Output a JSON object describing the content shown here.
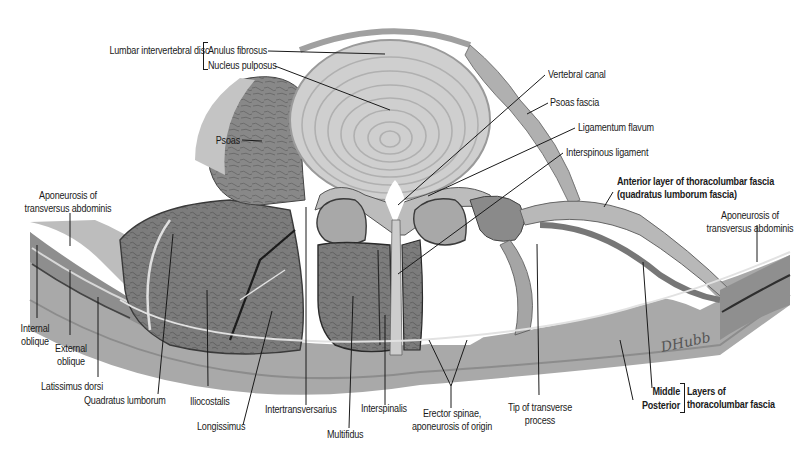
{
  "figure": {
    "colors": {
      "background": "#ffffff",
      "label_text": "#1a1a1a",
      "leader_line": "#1a1a1a",
      "disc_light": "#d6d6d6",
      "disc_ring": "#b4b4b4",
      "muscle_dark": "#6e6e6e",
      "muscle_mid": "#8a8a8a",
      "fascia_light": "#c8c8c8",
      "skin_band": "#a8a8a8"
    },
    "signature": "DHubb"
  },
  "labels": {
    "lumbar_disc": "Lumbar intervertebral disc",
    "anulus_fibrosus": "Anulus fibrosus",
    "nucleus_pulposus": "Nucleus pulposus",
    "vertebral_canal": "Vertebral canal",
    "psoas_fascia": "Psoas fascia",
    "ligamentum_flavum": "Ligamentum flavum",
    "interspinous_ligament": "Interspinous ligament",
    "psoas": "Psoas",
    "anterior_layer_1": "Anterior layer of thoracolumbar fascia",
    "anterior_layer_2": "(quadratus lumborum fascia)",
    "apon_left_1": "Aponeurosis of",
    "apon_left_2": "transversus abdominis",
    "apon_right_1": "Aponeurosis of",
    "apon_right_2": "transversus abdominis",
    "internal_oblique_1": "Internal",
    "internal_oblique_2": "oblique",
    "external_oblique_1": "External",
    "external_oblique_2": "oblique",
    "latissimus_dorsi": "Latissimus dorsi",
    "quadratus_lumborum": "Quadratus lumborum",
    "iliocostalis": "Iliocostalis",
    "longissimus": "Longissimus",
    "intertransversarius": "Intertransversarius",
    "multifidus": "Multifidus",
    "interspinalis": "Interspinalis",
    "erector_1": "Erector spinae,",
    "erector_2": "aponeurosis of origin",
    "tip_transverse_1": "Tip of transverse",
    "tip_transverse_2": "process",
    "middle": "Middle",
    "posterior": "Posterior",
    "layers_1": "Layers of",
    "layers_2": "thoracolumbar fascia"
  }
}
